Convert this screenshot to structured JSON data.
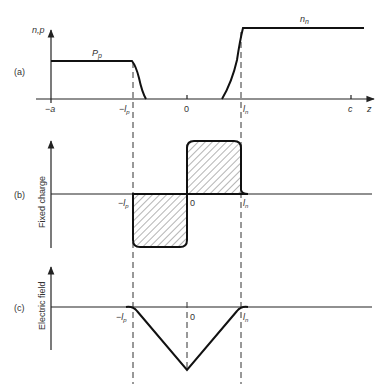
{
  "figure": {
    "panels": [
      {
        "id": "a",
        "label": "(a)",
        "y_axis_label": "n,p",
        "curve_labels": {
          "p_side": "P",
          "p_side_sub": "p",
          "n_side": "n",
          "n_side_sub": "n"
        },
        "x_ticks": [
          {
            "label": "−a"
          },
          {
            "label": "−l",
            "sub": "p"
          },
          {
            "label": "0"
          },
          {
            "label": "l",
            "sub": "n"
          },
          {
            "label": "c"
          }
        ],
        "x_axis_label": "z"
      },
      {
        "id": "b",
        "label": "(b)",
        "y_axis_label": "Fixed charge",
        "x_ticks": [
          {
            "label": "−l",
            "sub": "p"
          },
          {
            "label": "0"
          },
          {
            "label": "l",
            "sub": "n"
          }
        ]
      },
      {
        "id": "c",
        "label": "(c)",
        "y_axis_label": "Electric field",
        "x_ticks": [
          {
            "label": "−l",
            "sub": "p"
          },
          {
            "label": "0"
          },
          {
            "label": "l",
            "sub": "n"
          }
        ]
      }
    ]
  }
}
